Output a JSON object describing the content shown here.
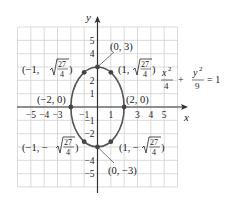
{
  "chart_data": {
    "type": "line",
    "title": "",
    "equation": {
      "x_num": "x",
      "x_den": "4",
      "y_num": "y",
      "y_den": "9",
      "plus": "+",
      "eq": "= 1"
    },
    "xlabel": "x",
    "ylabel": "y",
    "xlim": [
      -6,
      6
    ],
    "ylim": [
      -6,
      6
    ],
    "grid": true,
    "x_ticks": [
      {
        "v": -5,
        "t": "−5"
      },
      {
        "v": -4,
        "t": "−4"
      },
      {
        "v": -3,
        "t": "−3"
      },
      {
        "v": -1,
        "t": "−1"
      },
      {
        "v": 1,
        "t": "1"
      },
      {
        "v": 3,
        "t": "3"
      },
      {
        "v": 4,
        "t": "4"
      },
      {
        "v": 5,
        "t": "5"
      }
    ],
    "y_ticks": [
      {
        "v": 5,
        "t": "5"
      },
      {
        "v": 4,
        "t": "4"
      },
      {
        "v": 2,
        "t": "2"
      },
      {
        "v": 1,
        "t": "1"
      },
      {
        "v": -1,
        "t": "−1"
      },
      {
        "v": -2,
        "t": "−2"
      },
      {
        "v": -4,
        "t": "−4"
      },
      {
        "v": -5,
        "t": "−5"
      }
    ],
    "series": [
      {
        "name": "ellipse x^2/4 + y^2/9 = 1",
        "center": [
          0,
          0
        ],
        "a": 2,
        "b": 3
      }
    ],
    "points": [
      {
        "x": 0,
        "y": 3,
        "label": "(0, 3)"
      },
      {
        "x": 0,
        "y": -3,
        "label": "(0, −3)"
      },
      {
        "x": -2,
        "y": 0,
        "label": "(−2, 0)"
      },
      {
        "x": 2,
        "y": 0,
        "label": "(2, 0)"
      },
      {
        "x": -1,
        "y": 2.598,
        "label": "(−1, √(27/4))"
      },
      {
        "x": 1,
        "y": 2.598,
        "label": "(1, √(27/4))"
      },
      {
        "x": -1,
        "y": -2.598,
        "label": "(−1, −√(27/4))"
      },
      {
        "x": 1,
        "y": -2.598,
        "label": "(1, −√(27/4))"
      }
    ],
    "labels": {
      "p03": "(0, 3)",
      "p0m3": "(0, −3)",
      "pm20": "(−2, 0)",
      "p20": "(2, 0)",
      "pm1_open": "(−1, ",
      "p1_open": "(1, ",
      "pm1_neg_open": "(−1, −",
      "p1_neg_open": "(1, −",
      "frac_num": "27",
      "frac_den": "4",
      "close": ")"
    },
    "colors": {
      "curve": "#555555",
      "grid": "#d0d0d0",
      "axis": "#333333",
      "point": "#444444"
    }
  }
}
